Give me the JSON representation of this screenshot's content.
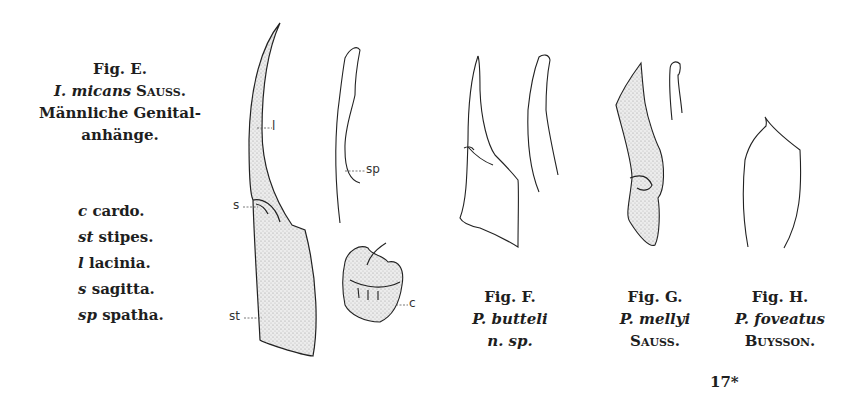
{
  "figure_e": {
    "title": "Fig. E.",
    "species_italic": "I. micans",
    "species_author": "Sauss.",
    "description_line1": "Männliche Genital-",
    "description_line2": "anhänge.",
    "legend": [
      {
        "abbr": "c",
        "term": "cardo."
      },
      {
        "abbr": "st",
        "term": "stipes."
      },
      {
        "abbr": "l",
        "term": "lacinia."
      },
      {
        "abbr": "s",
        "term": "sagitta."
      },
      {
        "abbr": "sp",
        "term": "spatha."
      }
    ],
    "drawing_labels": {
      "l": "l",
      "s": "s",
      "st": "st",
      "sp": "sp",
      "c": "c"
    }
  },
  "figure_f": {
    "title": "Fig. F.",
    "species_italic": "P. butteli",
    "note_italic": "n. sp."
  },
  "figure_g": {
    "title": "Fig. G.",
    "species_italic": "P. mellyi",
    "species_author": "Sauss."
  },
  "figure_h": {
    "title": "Fig. H.",
    "species_italic": "P. foveatus",
    "species_author": "Buysson."
  },
  "page_marker": "17*",
  "colors": {
    "ink": "#1e1e1e",
    "stipple": "#c8c8c8",
    "paper": "#ffffff"
  }
}
